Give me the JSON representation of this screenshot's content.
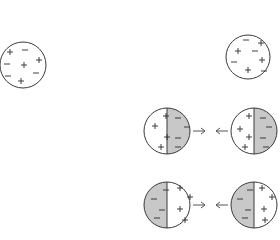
{
  "diagram": {
    "colors": {
      "outline": "#3a3a3a",
      "shaded_half": "#c8c8c8",
      "background": "#ffffff",
      "arrow": "#555555"
    },
    "spheres": [
      {
        "id": "neutral-left",
        "cx": 23,
        "cy": 65,
        "r": 23,
        "state": "neutral (mixed charges)",
        "charges": [
          {
            "s": "+",
            "x": 10,
            "y": 52
          },
          {
            "s": "-",
            "x": 25,
            "y": 50
          },
          {
            "s": "-",
            "x": 7,
            "y": 64
          },
          {
            "s": "+",
            "x": 24,
            "y": 65
          },
          {
            "s": "+",
            "x": 39,
            "y": 60
          },
          {
            "s": "-",
            "x": 8,
            "y": 76
          },
          {
            "s": "-",
            "x": 36,
            "y": 73
          },
          {
            "s": "+",
            "x": 21,
            "y": 81
          }
        ]
      },
      {
        "id": "neutral-right",
        "cx": 248,
        "cy": 57,
        "r": 22,
        "state": "neutral (mixed charges)",
        "charges": [
          {
            "s": "-",
            "x": 246,
            "y": 40
          },
          {
            "s": "+",
            "x": 261,
            "y": 43
          },
          {
            "s": "+",
            "x": 238,
            "y": 51
          },
          {
            "s": "-",
            "x": 255,
            "y": 51
          },
          {
            "s": "-",
            "x": 234,
            "y": 62
          },
          {
            "s": "+",
            "x": 262,
            "y": 60
          },
          {
            "s": "+",
            "x": 248,
            "y": 70
          },
          {
            "s": "-",
            "x": 264,
            "y": 71
          }
        ]
      },
      {
        "id": "polarized-mid-left",
        "cx": 167,
        "cy": 131,
        "r": 23,
        "shaded_side": "right",
        "left_charges": [
          {
            "s": "+",
            "x": 166,
            "y": 116
          },
          {
            "s": "+",
            "x": 155,
            "y": 126
          },
          {
            "s": "+",
            "x": 167,
            "y": 137
          },
          {
            "s": "+",
            "x": 161,
            "y": 147
          }
        ],
        "right_charges": [
          {
            "s": "-",
            "x": 178,
            "y": 118
          },
          {
            "s": "-",
            "x": 187,
            "y": 127
          },
          {
            "s": "-",
            "x": 178,
            "y": 138
          },
          {
            "s": "-",
            "x": 178,
            "y": 147
          }
        ]
      },
      {
        "id": "polarized-mid-right",
        "cx": 254,
        "cy": 131,
        "r": 23,
        "shaded_side": "right",
        "left_charges": [
          {
            "s": "+",
            "x": 249,
            "y": 116
          },
          {
            "s": "+",
            "x": 240,
            "y": 129
          },
          {
            "s": "+",
            "x": 249,
            "y": 137
          },
          {
            "s": "+",
            "x": 245,
            "y": 147
          }
        ],
        "right_charges": [
          {
            "s": "-",
            "x": 263,
            "y": 118
          },
          {
            "s": "-",
            "x": 269,
            "y": 127
          },
          {
            "s": "-",
            "x": 263,
            "y": 138
          },
          {
            "s": "-",
            "x": 266,
            "y": 147
          }
        ]
      },
      {
        "id": "polarized-bottom-left",
        "cx": 167,
        "cy": 205,
        "r": 23,
        "shaded_side": "left",
        "left_charges": [
          {
            "s": "-",
            "x": 166,
            "y": 190
          },
          {
            "s": "-",
            "x": 154,
            "y": 199
          },
          {
            "s": "-",
            "x": 162,
            "y": 210
          },
          {
            "s": "-",
            "x": 157,
            "y": 218
          }
        ],
        "right_charges": [
          {
            "s": "+",
            "x": 180,
            "y": 188
          },
          {
            "s": "+",
            "x": 190,
            "y": 197
          },
          {
            "s": "+",
            "x": 180,
            "y": 209
          },
          {
            "s": "+",
            "x": 185,
            "y": 220
          }
        ]
      },
      {
        "id": "polarized-bottom-right",
        "cx": 254,
        "cy": 205,
        "r": 23,
        "shaded_side": "left",
        "left_charges": [
          {
            "s": "-",
            "x": 250,
            "y": 190
          },
          {
            "s": "-",
            "x": 240,
            "y": 199
          },
          {
            "s": "-",
            "x": 248,
            "y": 210
          },
          {
            "s": "-",
            "x": 245,
            "y": 218
          }
        ],
        "right_charges": [
          {
            "s": "+",
            "x": 262,
            "y": 188
          },
          {
            "s": "+",
            "x": 272,
            "y": 197
          },
          {
            "s": "+",
            "x": 264,
            "y": 209
          },
          {
            "s": "+",
            "x": 265,
            "y": 220
          }
        ]
      }
    ],
    "arrows": [
      {
        "id": "mid-right-arrow",
        "direction": "right",
        "x1": 193,
        "x2": 205,
        "y": 131
      },
      {
        "id": "mid-left-arrow",
        "direction": "left",
        "x1": 228,
        "x2": 216,
        "y": 131
      },
      {
        "id": "bottom-right-arrow",
        "direction": "right",
        "x1": 193,
        "x2": 205,
        "y": 205
      },
      {
        "id": "bottom-left-arrow",
        "direction": "left",
        "x1": 228,
        "x2": 216,
        "y": 205
      }
    ]
  }
}
